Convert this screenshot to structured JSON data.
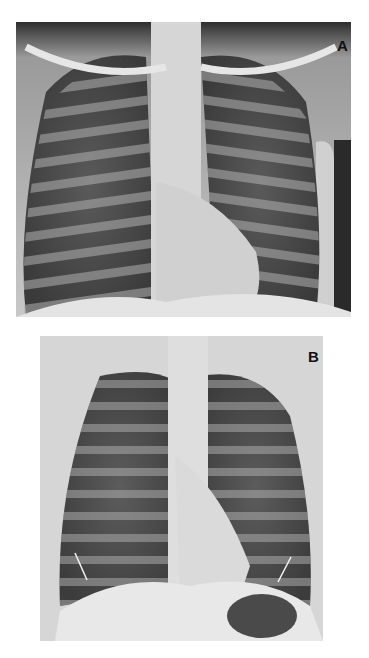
{
  "figure": {
    "panels": [
      {
        "label": "A",
        "description": "Frontal chest radiograph",
        "bounds": {
          "x": 16,
          "y": 22,
          "width": 335,
          "height": 295
        }
      },
      {
        "label": "B",
        "description": "Frontal chest radiograph with two arrows at the costophrenic region",
        "bounds": {
          "x": 40,
          "y": 336,
          "width": 283,
          "height": 305
        },
        "annotations": [
          {
            "type": "arrow-line",
            "side": "right-hemithorax",
            "from": [
              75,
              553
            ],
            "to": [
              87,
              580
            ],
            "color": "#f0f0f0"
          },
          {
            "type": "arrow-line",
            "side": "left-hemithorax",
            "from": [
              291,
              557
            ],
            "to": [
              278,
              582
            ],
            "color": "#f0f0f0"
          }
        ]
      }
    ],
    "colors": {
      "background": "#ffffff",
      "lung_dark": "#3a3a3a",
      "bone_light": "#dcdcdc",
      "label": "#111111"
    }
  }
}
